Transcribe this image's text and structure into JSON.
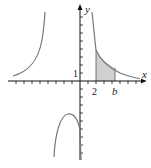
{
  "figure": {
    "axes": {
      "x_label": "x",
      "y_label": "y",
      "tick_labels": {
        "x_2": "2",
        "x_b": "b",
        "y_1": "1"
      },
      "tick_spacing_units": 1
    },
    "curves": [
      {
        "name": "left-branch",
        "description": "rises to +infinity near vertical asymptote x≈-4"
      },
      {
        "name": "middle-branch",
        "description": "downward arch between x≈-4 and x=0, peak near (-1.5,-4)"
      },
      {
        "name": "right-branch",
        "description": "decreasing from +infinity near x=0 toward the x-axis"
      }
    ],
    "shaded_region": {
      "from": "2",
      "to": "b",
      "fill": "#cfcfcf",
      "description": "area under right branch between x=2 and x=b"
    },
    "colors": {
      "curve": "#777777",
      "axis": "#111111",
      "shade": "#cfcfcf"
    }
  }
}
